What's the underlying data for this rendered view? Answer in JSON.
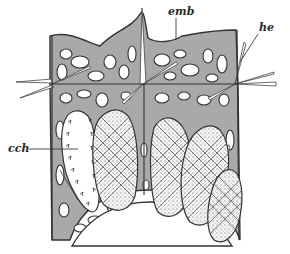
{
  "figure": {
    "type": "scientific line drawing",
    "fill_color": "#a9a9a9",
    "line_color": "#333333",
    "labels": [
      {
        "id": "emb",
        "text": "emb",
        "x": 170,
        "y": 15
      },
      {
        "id": "he",
        "text": "he",
        "x": 258,
        "y": 31
      },
      {
        "id": "cch",
        "text": "cch",
        "x": 8,
        "y": 151
      }
    ]
  }
}
